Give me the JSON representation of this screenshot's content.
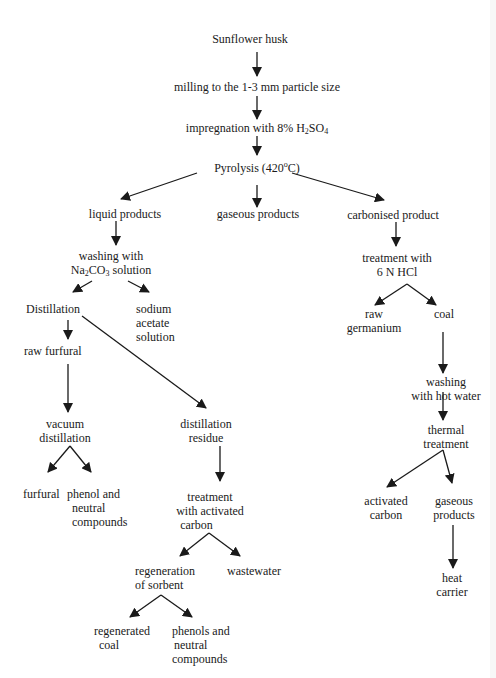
{
  "diagram": {
    "nodes": {
      "sunflower_husk": {
        "lines": [
          "Sunflower husk"
        ]
      },
      "milling": {
        "lines": [
          "milling to the 1-3 mm particle size"
        ]
      },
      "impregnation": {
        "prefix": "impregnation with 8% H",
        "sub1": "2",
        "mid": "SO",
        "sub2": "4"
      },
      "pyrolysis": {
        "prefix": "Pyrolysis (420",
        "sup": "o",
        "suffix": "C)"
      },
      "liquid_products": {
        "lines": [
          "liquid products"
        ]
      },
      "gaseous_products_top": {
        "lines": [
          "gaseous products"
        ]
      },
      "carbonised_product": {
        "lines": [
          "carbonised product"
        ]
      },
      "washing_na2co3": {
        "line1": "washing with",
        "prefix": "Na",
        "sub1": "2",
        "mid": "CO",
        "sub2": "3",
        "suffix": " solution"
      },
      "treatment_hcl": {
        "lines": [
          "treatment with",
          "6 N HCl"
        ]
      },
      "distillation": {
        "lines": [
          "Distillation"
        ]
      },
      "sodium_acetate": {
        "lines": [
          "sodium",
          "acetate",
          "solution"
        ]
      },
      "raw_germanium": {
        "lines": [
          "raw",
          "germanium"
        ]
      },
      "coal": {
        "lines": [
          "coal"
        ]
      },
      "raw_furfural": {
        "lines": [
          "raw furfural"
        ]
      },
      "washing_hot_water": {
        "lines": [
          "washing",
          "with hot water"
        ]
      },
      "vacuum_distillation": {
        "lines": [
          "vacuum",
          "distillation"
        ]
      },
      "distillation_residue": {
        "lines": [
          "distillation",
          "residue"
        ]
      },
      "thermal_treatment": {
        "lines": [
          "thermal",
          "treatment"
        ]
      },
      "furfural": {
        "lines": [
          "furfural"
        ]
      },
      "phenol_neutral": {
        "lines": [
          "phenol and",
          "neutral",
          "compounds"
        ]
      },
      "treatment_activated_carbon": {
        "lines": [
          "treatment",
          "with activated",
          "carbon"
        ]
      },
      "activated_carbon": {
        "lines": [
          "activated",
          "carbon"
        ]
      },
      "gaseous_products_right": {
        "lines": [
          "gaseous",
          "products"
        ]
      },
      "regeneration_sorbent": {
        "lines": [
          "regeneration",
          "of sorbent"
        ]
      },
      "wastewater": {
        "lines": [
          "wastewater"
        ]
      },
      "heat_carrier": {
        "lines": [
          "heat",
          "carrier"
        ]
      },
      "regenerated_coal": {
        "lines": [
          "regenerated",
          "coal"
        ]
      },
      "phenols_neutral": {
        "lines": [
          "phenols and",
          "neutral",
          "compounds"
        ]
      }
    },
    "colors": {
      "line": "#1a1a1a",
      "text": "#1a1a1a",
      "background": "#ffffff"
    }
  }
}
